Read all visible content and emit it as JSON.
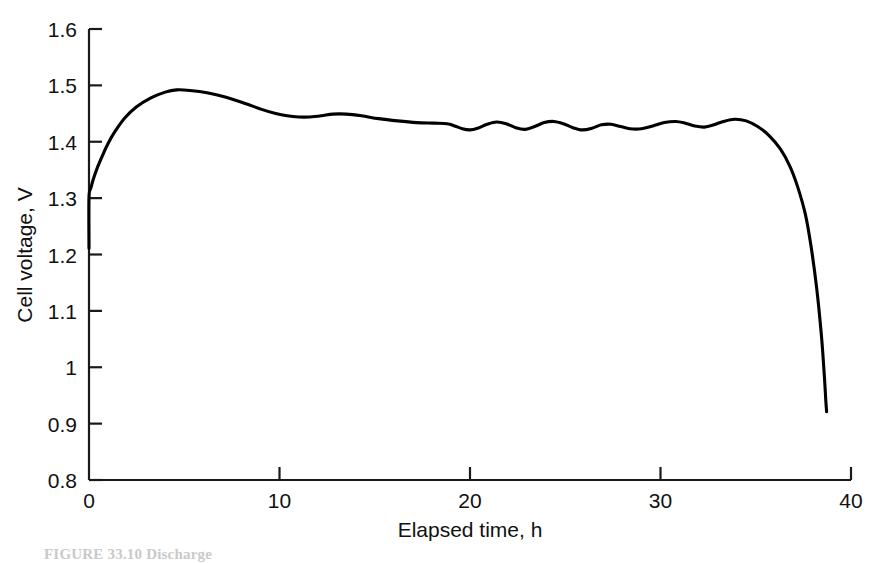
{
  "figure": {
    "background_color": "#ffffff",
    "line_color": "#000000",
    "axis_color": "#1a1a1a",
    "caption": "FIGURE 33.10   Discharge"
  },
  "chart_data": {
    "type": "line",
    "title": "",
    "xlabel": "Elapsed time, h",
    "ylabel": "Cell voltage, V",
    "xlim": [
      0,
      40
    ],
    "ylim": [
      0.8,
      1.6
    ],
    "xticks": [
      0,
      10,
      20,
      30,
      40
    ],
    "xtick_labels": [
      "0",
      "10",
      "20",
      "30",
      "40"
    ],
    "yticks": [
      0.8,
      0.9,
      1.0,
      1.1,
      1.2,
      1.3,
      1.4,
      1.5,
      1.6
    ],
    "ytick_labels": [
      "0.8",
      "0.9",
      "1",
      "1.1",
      "1.2",
      "1.3",
      "1.4",
      "1.5",
      "1.6"
    ],
    "grid": false,
    "legend": false,
    "series": [
      {
        "name": "Cell voltage",
        "x": [
          0.0,
          0.0,
          0.1,
          0.25,
          0.45,
          0.7,
          1.0,
          1.4,
          1.9,
          2.5,
          3.2,
          4.0,
          4.6,
          5.3,
          6.2,
          7.2,
          8.2,
          9.1,
          9.8,
          10.4,
          11.0,
          11.6,
          12.2,
          12.8,
          13.5,
          14.3,
          15.2,
          16.2,
          17.2,
          18.1,
          18.8,
          19.2,
          19.6,
          20.0,
          20.4,
          20.9,
          21.4,
          21.9,
          22.4,
          22.9,
          23.4,
          23.9,
          24.4,
          24.9,
          25.4,
          25.9,
          26.4,
          26.9,
          27.4,
          27.9,
          28.4,
          29.0,
          29.6,
          30.2,
          30.8,
          31.3,
          31.8,
          32.3,
          32.8,
          33.3,
          33.9,
          34.5,
          35.1,
          35.7,
          36.3,
          36.8,
          37.2,
          37.6,
          37.9,
          38.2,
          38.45,
          38.6,
          38.68,
          38.72
        ],
        "y": [
          1.211,
          1.301,
          1.318,
          1.336,
          1.355,
          1.375,
          1.397,
          1.42,
          1.443,
          1.462,
          1.477,
          1.488,
          1.492,
          1.491,
          1.487,
          1.479,
          1.468,
          1.457,
          1.45,
          1.446,
          1.444,
          1.444,
          1.446,
          1.449,
          1.449,
          1.446,
          1.441,
          1.437,
          1.434,
          1.433,
          1.432,
          1.428,
          1.423,
          1.421,
          1.424,
          1.431,
          1.435,
          1.432,
          1.425,
          1.422,
          1.427,
          1.434,
          1.436,
          1.432,
          1.425,
          1.421,
          1.424,
          1.43,
          1.431,
          1.427,
          1.423,
          1.423,
          1.428,
          1.434,
          1.436,
          1.433,
          1.428,
          1.426,
          1.43,
          1.436,
          1.44,
          1.437,
          1.427,
          1.411,
          1.387,
          1.356,
          1.32,
          1.272,
          1.215,
          1.14,
          1.055,
          0.985,
          0.94,
          0.921
        ]
      }
    ],
    "annotations": [
      {
        "text": "initial vertical rise from 1.21 V to 1.30 V at t = 0 h"
      },
      {
        "text": "peak voltage 1.49 V near t = 4.5 h"
      },
      {
        "text": "voltage ripples between 1.42 V and 1.44 V from t = 19 h to t = 33 h"
      },
      {
        "text": "sharp end-of-discharge drop to 0.92 V at t = 38.7 h"
      }
    ]
  }
}
